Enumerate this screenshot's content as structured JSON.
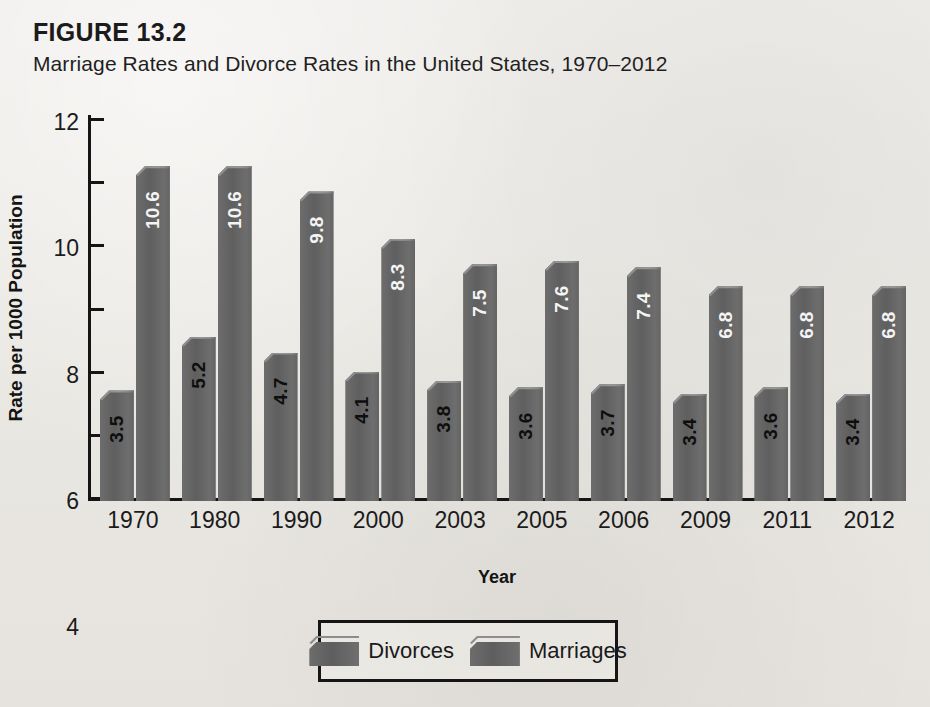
{
  "figure": {
    "label": "FIGURE 13.2",
    "title": "Marriage Rates and Divorce Rates in the United States, 1970–2012"
  },
  "legend": {
    "items": [
      {
        "label": "Divorces",
        "color": "#656565"
      },
      {
        "label": "Marriages",
        "color": "#656565"
      }
    ]
  },
  "axes": {
    "ylabel": "Rate per 1000 Population",
    "xlabel": "Year",
    "yticks": [
      "0",
      "2",
      "4",
      "6",
      "8",
      "10",
      "12"
    ]
  },
  "chart_data": {
    "type": "bar",
    "title": "Marriage Rates and Divorce Rates in the United States, 1970–2012",
    "xlabel": "Year",
    "ylabel": "Rate per 1000 Population",
    "ylim": [
      0,
      12
    ],
    "ytick_step": 2,
    "grid": false,
    "legend_position": "bottom",
    "categories": [
      "1970",
      "1980",
      "1990",
      "2000",
      "2003",
      "2005",
      "2006",
      "2009",
      "2011",
      "2012"
    ],
    "series": [
      {
        "name": "Divorces",
        "color": "#656565",
        "label_color": "#0e0e0e",
        "values": [
          3.5,
          5.2,
          4.7,
          4.1,
          3.8,
          3.6,
          3.7,
          3.4,
          3.6,
          3.4
        ],
        "labels": [
          "3.5",
          "5.2",
          "4.7",
          "4.1",
          "3.8",
          "3.6",
          "3.7",
          "3.4",
          "3.6",
          "3.4"
        ]
      },
      {
        "name": "Marriages",
        "color": "#656565",
        "label_color": "#f4f4f4",
        "values": [
          10.6,
          10.6,
          9.8,
          8.3,
          7.5,
          7.6,
          7.4,
          6.8,
          6.8,
          6.8
        ],
        "labels": [
          "10.6",
          "10.6",
          "9.8",
          "8.3",
          "7.5",
          "7.6",
          "7.4",
          "6.8",
          "6.8",
          "6.8"
        ]
      }
    ]
  }
}
